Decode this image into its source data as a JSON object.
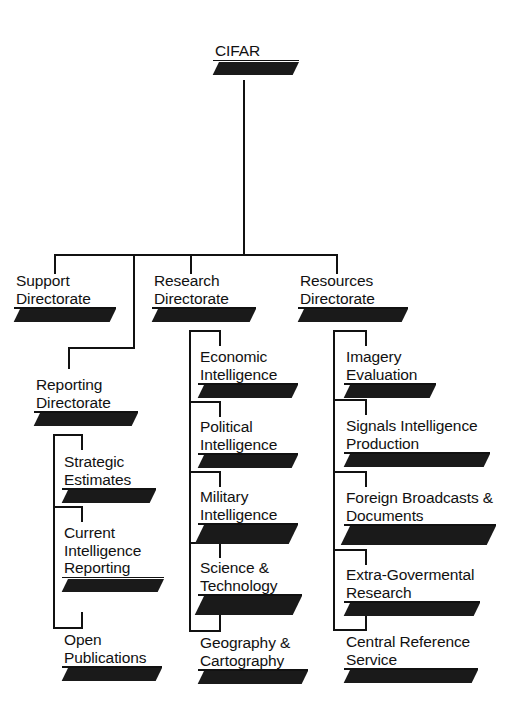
{
  "diagram": {
    "type": "organization-chart",
    "title": "CIFAR",
    "nodes": {
      "root": {
        "label": "CIFAR",
        "level": 0
      },
      "support": {
        "label": "Support\nDirectorate",
        "level": 1
      },
      "research": {
        "label": "Research\nDirectorate",
        "level": 1
      },
      "resources": {
        "label": "Resources\nDirectorate",
        "level": 1
      },
      "reporting": {
        "label": "Reporting\nDirectorate",
        "level": 2
      },
      "strategic": {
        "label": "Strategic\nEstimates",
        "level": 3
      },
      "current": {
        "label": "Current\nIntelligence\nReporting",
        "level": 3
      },
      "openpub": {
        "label": "Open\nPublications",
        "level": 3
      },
      "economic": {
        "label": "Economic\nIntelligence",
        "level": 2
      },
      "political": {
        "label": "Political\nIntelligence",
        "level": 2
      },
      "military": {
        "label": "Military\nIntelligence",
        "level": 2
      },
      "science": {
        "label": "Science &\nTechnology",
        "level": 2
      },
      "geography": {
        "label": "Geography &\nCartography",
        "level": 2
      },
      "imagery": {
        "label": "Imagery\nEvaluation",
        "level": 2
      },
      "signals": {
        "label": "Signals Intelligence\nProduction",
        "level": 2
      },
      "foreign": {
        "label": "Foreign Broadcasts &\nDocuments",
        "level": 2
      },
      "extragov": {
        "label": "Extra-Govermental\nResearch",
        "level": 2
      },
      "centralref": {
        "label": "Central Reference\nService",
        "level": 2
      }
    },
    "edges": [
      {
        "from": "root",
        "to": "support"
      },
      {
        "from": "root",
        "to": "research"
      },
      {
        "from": "root",
        "to": "resources"
      },
      {
        "from": "root",
        "to": "reporting"
      },
      {
        "from": "reporting",
        "to": "strategic"
      },
      {
        "from": "reporting",
        "to": "current"
      },
      {
        "from": "reporting",
        "to": "openpub"
      },
      {
        "from": "research",
        "to": "economic"
      },
      {
        "from": "research",
        "to": "political"
      },
      {
        "from": "research",
        "to": "military"
      },
      {
        "from": "research",
        "to": "science"
      },
      {
        "from": "research",
        "to": "geography"
      },
      {
        "from": "resources",
        "to": "imagery"
      },
      {
        "from": "resources",
        "to": "signals"
      },
      {
        "from": "resources",
        "to": "foreign"
      },
      {
        "from": "resources",
        "to": "extragov"
      },
      {
        "from": "resources",
        "to": "centralref"
      }
    ],
    "colors": {
      "line": "#111111",
      "slab": "#1a1a1a",
      "text": "#111111",
      "background": "#ffffff"
    }
  }
}
